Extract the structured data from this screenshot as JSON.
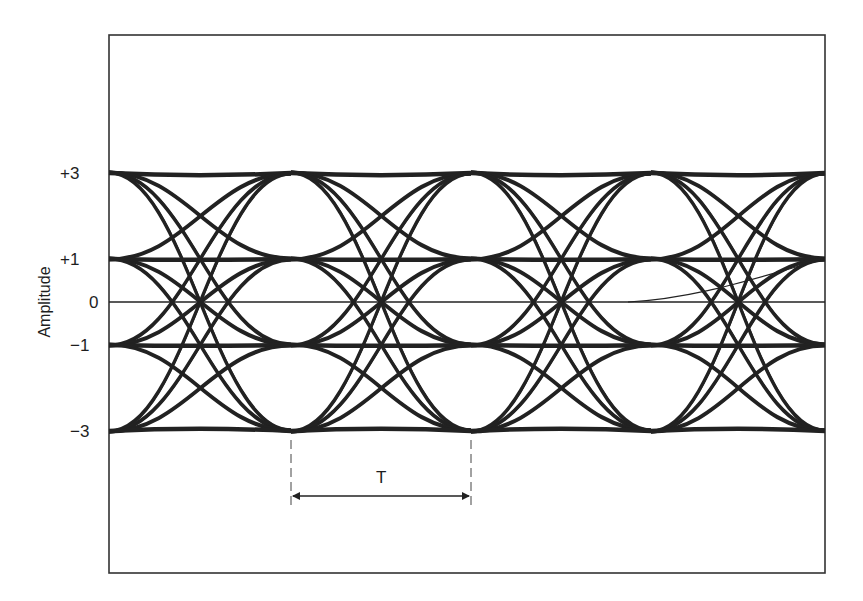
{
  "figure": {
    "type": "eye-diagram",
    "y_axis_label": "Amplitude",
    "levels": [
      {
        "label": "+3",
        "value": 3
      },
      {
        "label": "+1",
        "value": 1
      },
      {
        "label": "0",
        "value": 0
      },
      {
        "label": "−1",
        "value": -1
      },
      {
        "label": "−3",
        "value": -3
      }
    ],
    "period_label": "T",
    "colors": {
      "trace": "#222222",
      "frame": "#333333",
      "background": "#ffffff"
    }
  }
}
